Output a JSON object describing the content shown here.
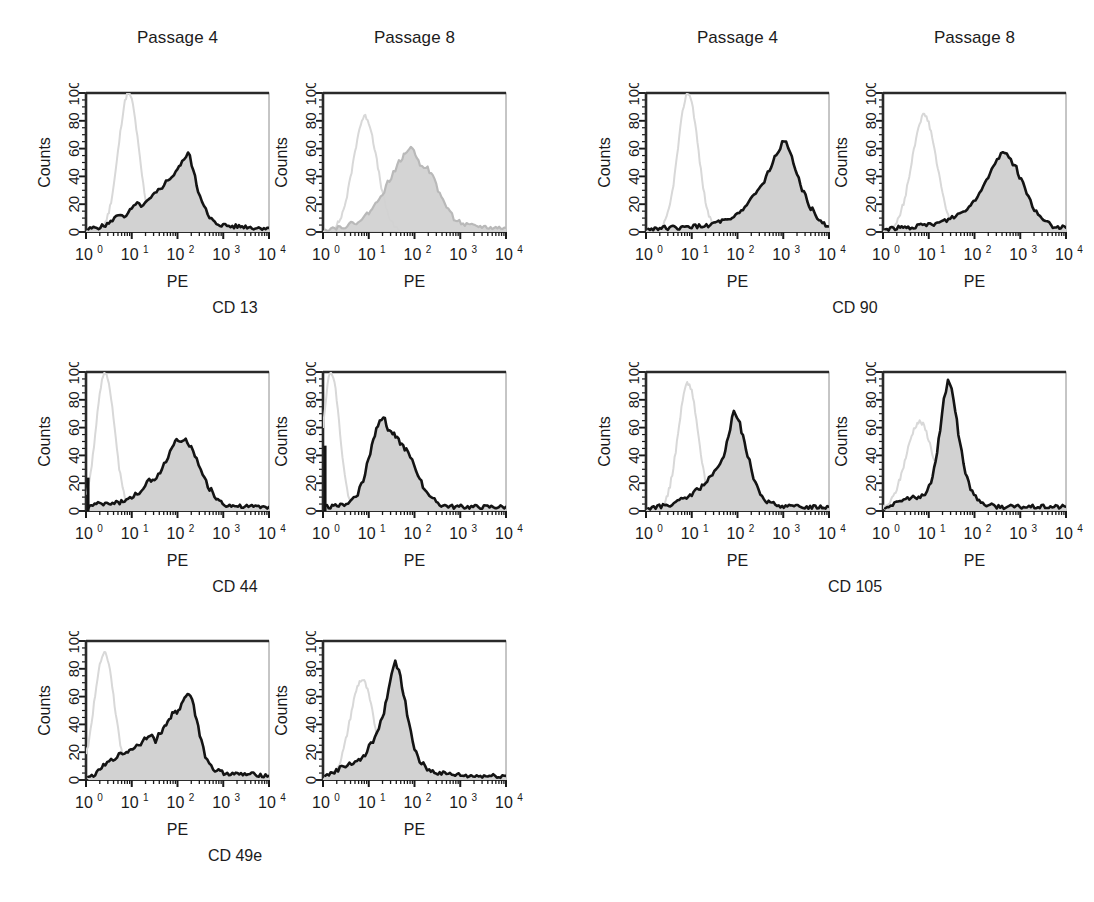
{
  "figure": {
    "background": "#ffffff",
    "width": 1094,
    "height": 902,
    "column_headers": [
      {
        "label": "Passage 4"
      },
      {
        "label": "Passage 8"
      },
      {
        "label": "Passage 4"
      },
      {
        "label": "Passage 8"
      }
    ],
    "marker_labels": [
      {
        "label": "CD 13"
      },
      {
        "label": "CD 90"
      },
      {
        "label": "CD 44"
      },
      {
        "label": "CD 105"
      },
      {
        "label": "CD 49e"
      }
    ]
  },
  "axes": {
    "x_title": "PE",
    "y_title": "Counts",
    "x_ticks": [
      {
        "mantissa": "10",
        "exponent": "0"
      },
      {
        "mantissa": "10",
        "exponent": "1"
      },
      {
        "mantissa": "10",
        "exponent": "2"
      },
      {
        "mantissa": "10",
        "exponent": "3"
      },
      {
        "mantissa": "10",
        "exponent": "4"
      }
    ],
    "y_ticks": [
      "0",
      "20",
      "40",
      "60",
      "80",
      "100"
    ],
    "x_range_decades": [
      0,
      4
    ],
    "y_range": [
      0,
      100
    ],
    "x_scale": "log",
    "grid": false
  },
  "style": {
    "fill_color": "#d2d2d2",
    "sample_line_color": "#141414",
    "control_line_color": "#d8d8d8",
    "frame_color": "#2a2a2a",
    "tick_color": "#1a1a1a"
  },
  "chart_data": {
    "type": "line",
    "xlabel": "PE",
    "ylabel": "Counts",
    "xlim": [
      1,
      10000
    ],
    "ylim": [
      0,
      100
    ],
    "xscale": "log",
    "grid": false,
    "legend": "none",
    "panels": [
      {
        "marker": "CD 13",
        "passage": "Passage 4",
        "row": 0,
        "col": 0,
        "control": {
          "name": "isotype control",
          "peak_decade": 0.93,
          "peak_height": 100,
          "width": 0.22
        },
        "sample": {
          "name": "stained sample",
          "peak_decade": 2.23,
          "peak_height": 57,
          "x_decades": [
            0.05,
            0.2,
            0.35,
            0.5,
            0.62,
            0.75,
            0.88,
            1.0,
            1.12,
            1.25,
            1.38,
            1.5,
            1.62,
            1.75,
            1.88,
            2.0,
            2.1,
            2.23,
            2.35,
            2.45,
            2.58,
            2.7,
            2.85,
            3.0,
            3.2,
            3.45,
            3.7,
            4.0
          ],
          "y_values": [
            2,
            3,
            4,
            6,
            10,
            13,
            11,
            17,
            20,
            19,
            23,
            27,
            31,
            36,
            40,
            45,
            50,
            57,
            45,
            30,
            18,
            10,
            6,
            5,
            4,
            4,
            3,
            3
          ]
        }
      },
      {
        "marker": "CD 13",
        "passage": "Passage 8",
        "row": 0,
        "col": 1,
        "faded": true,
        "control": {
          "name": "isotype control",
          "peak_decade": 0.92,
          "peak_height": 83,
          "width": 0.26
        },
        "sample": {
          "name": "stained sample",
          "peak_decade": 1.92,
          "peak_height": 62,
          "x_decades": [
            0.05,
            0.25,
            0.45,
            0.65,
            0.85,
            1.0,
            1.15,
            1.3,
            1.45,
            1.58,
            1.7,
            1.8,
            1.92,
            2.02,
            2.12,
            2.25,
            2.4,
            2.55,
            2.7,
            2.9,
            3.1,
            3.4,
            3.7,
            4.0
          ],
          "y_values": [
            2,
            3,
            4,
            6,
            9,
            14,
            20,
            28,
            37,
            45,
            52,
            56,
            62,
            56,
            49,
            47,
            40,
            28,
            18,
            9,
            5,
            4,
            3,
            3
          ]
        }
      },
      {
        "marker": "CD 90",
        "passage": "Passage 4",
        "row": 0,
        "col": 2,
        "control": {
          "name": "isotype control",
          "peak_decade": 0.92,
          "peak_height": 100,
          "width": 0.22
        },
        "sample": {
          "name": "stained sample",
          "peak_decade": 3.02,
          "peak_height": 66,
          "x_decades": [
            0.05,
            0.3,
            0.55,
            0.8,
            1.0,
            1.2,
            1.4,
            1.55,
            1.7,
            1.85,
            2.0,
            2.12,
            2.25,
            2.4,
            2.55,
            2.7,
            2.85,
            3.02,
            3.15,
            3.3,
            3.45,
            3.6,
            3.78,
            4.0
          ],
          "y_values": [
            2,
            3,
            3,
            3,
            4,
            4,
            5,
            7,
            8,
            8,
            13,
            16,
            22,
            28,
            34,
            44,
            55,
            66,
            57,
            43,
            28,
            17,
            9,
            4
          ]
        }
      },
      {
        "marker": "CD 90",
        "passage": "Passage 8",
        "row": 0,
        "col": 3,
        "control": {
          "name": "isotype control",
          "peak_decade": 0.9,
          "peak_height": 84,
          "width": 0.27
        },
        "sample": {
          "name": "stained sample",
          "peak_decade": 2.62,
          "peak_height": 58,
          "x_decades": [
            0.05,
            0.3,
            0.55,
            0.75,
            0.95,
            1.15,
            1.35,
            1.55,
            1.72,
            1.88,
            2.02,
            2.15,
            2.3,
            2.45,
            2.62,
            2.75,
            2.88,
            3.02,
            3.18,
            3.35,
            3.55,
            3.75,
            4.0
          ],
          "y_values": [
            2,
            3,
            3,
            4,
            5,
            6,
            8,
            11,
            14,
            18,
            24,
            31,
            40,
            50,
            58,
            54,
            48,
            38,
            25,
            14,
            7,
            4,
            3
          ]
        }
      },
      {
        "marker": "CD 44",
        "passage": "Passage 4",
        "row": 1,
        "col": 0,
        "spike_at_origin": 24,
        "control": {
          "name": "isotype control",
          "peak_decade": 0.42,
          "peak_height": 100,
          "width": 0.2
        },
        "sample": {
          "name": "stained sample",
          "peak_decade": 1.98,
          "peak_height": 53,
          "x_decades": [
            0.05,
            0.15,
            0.3,
            0.5,
            0.7,
            0.88,
            1.0,
            1.12,
            1.25,
            1.38,
            1.5,
            1.62,
            1.75,
            1.88,
            1.98,
            2.08,
            2.18,
            2.3,
            2.42,
            2.55,
            2.7,
            2.88,
            3.1,
            3.4,
            3.7,
            4.0
          ],
          "y_values": [
            3,
            4,
            5,
            5,
            6,
            8,
            9,
            13,
            15,
            22,
            21,
            28,
            36,
            46,
            53,
            49,
            51,
            46,
            37,
            26,
            16,
            8,
            4,
            3,
            3,
            3
          ]
        }
      },
      {
        "marker": "CD 44",
        "passage": "Passage 8",
        "row": 1,
        "col": 1,
        "spike_at_origin": 47,
        "control": {
          "name": "isotype control",
          "peak_decade": 0.18,
          "peak_height": 100,
          "width": 0.18
        },
        "sample": {
          "name": "stained sample",
          "peak_decade": 1.32,
          "peak_height": 68,
          "x_decades": [
            0.05,
            0.2,
            0.38,
            0.55,
            0.72,
            0.88,
            1.0,
            1.1,
            1.2,
            1.32,
            1.42,
            1.52,
            1.62,
            1.72,
            1.82,
            1.95,
            2.08,
            2.22,
            2.4,
            2.62,
            2.9,
            3.2,
            3.6,
            4.0
          ],
          "y_values": [
            3,
            3,
            4,
            6,
            11,
            22,
            38,
            52,
            62,
            68,
            59,
            56,
            52,
            48,
            44,
            36,
            26,
            16,
            8,
            4,
            3,
            3,
            3,
            3
          ]
        }
      },
      {
        "marker": "CD 105",
        "passage": "Passage 4",
        "row": 1,
        "col": 2,
        "control": {
          "name": "isotype control",
          "peak_decade": 0.92,
          "peak_height": 92,
          "width": 0.22
        },
        "sample": {
          "name": "stained sample",
          "peak_decade": 1.92,
          "peak_height": 72,
          "x_decades": [
            0.05,
            0.25,
            0.45,
            0.65,
            0.85,
            1.0,
            1.15,
            1.3,
            1.45,
            1.58,
            1.7,
            1.8,
            1.92,
            2.02,
            2.12,
            2.22,
            2.35,
            2.5,
            2.68,
            2.9,
            3.2,
            3.55,
            4.0
          ],
          "y_values": [
            2,
            3,
            4,
            6,
            9,
            12,
            16,
            20,
            26,
            31,
            40,
            52,
            72,
            66,
            54,
            40,
            24,
            12,
            6,
            4,
            3,
            3,
            3
          ]
        }
      },
      {
        "marker": "CD 105",
        "passage": "Passage 8",
        "row": 1,
        "col": 3,
        "control": {
          "name": "isotype control",
          "peak_decade": 0.8,
          "peak_height": 64,
          "width": 0.3
        },
        "sample": {
          "name": "stained sample",
          "peak_decade": 1.42,
          "peak_height": 94,
          "x_decades": [
            0.05,
            0.25,
            0.45,
            0.62,
            0.78,
            0.92,
            1.05,
            1.15,
            1.25,
            1.33,
            1.42,
            1.5,
            1.58,
            1.68,
            1.8,
            1.95,
            2.1,
            2.3,
            2.6,
            2.95,
            3.35,
            3.7,
            4.0
          ],
          "y_values": [
            3,
            5,
            8,
            10,
            9,
            12,
            20,
            36,
            58,
            80,
            94,
            88,
            72,
            50,
            28,
            14,
            7,
            4,
            3,
            3,
            3,
            3,
            3
          ]
        }
      },
      {
        "marker": "CD 49e",
        "passage": "Passage 4",
        "row": 2,
        "col": 0,
        "control": {
          "name": "isotype control",
          "peak_decade": 0.4,
          "peak_height": 92,
          "width": 0.22
        },
        "sample": {
          "name": "stained sample",
          "peak_decade": 2.22,
          "peak_height": 63,
          "x_decades": [
            0.05,
            0.2,
            0.38,
            0.55,
            0.72,
            0.88,
            1.02,
            1.15,
            1.28,
            1.4,
            1.52,
            1.62,
            1.72,
            1.82,
            1.92,
            2.02,
            2.12,
            2.22,
            2.32,
            2.42,
            2.52,
            2.65,
            2.82,
            3.05,
            3.35,
            3.7,
            4.0
          ],
          "y_values": [
            2,
            4,
            10,
            14,
            18,
            20,
            23,
            25,
            30,
            33,
            28,
            34,
            38,
            44,
            49,
            49,
            56,
            63,
            58,
            44,
            28,
            14,
            7,
            5,
            4,
            4,
            3
          ]
        }
      },
      {
        "marker": "CD 49e",
        "passage": "Passage 8",
        "row": 2,
        "col": 1,
        "control": {
          "name": "isotype control",
          "peak_decade": 0.85,
          "peak_height": 72,
          "width": 0.26
        },
        "sample": {
          "name": "stained sample",
          "peak_decade": 1.58,
          "peak_height": 86,
          "x_decades": [
            0.05,
            0.25,
            0.45,
            0.62,
            0.78,
            0.92,
            1.05,
            1.18,
            1.3,
            1.4,
            1.5,
            1.58,
            1.66,
            1.76,
            1.88,
            2.0,
            2.15,
            2.32,
            2.55,
            2.85,
            3.2,
            3.6,
            4.0
          ],
          "y_values": [
            3,
            6,
            10,
            12,
            14,
            18,
            26,
            34,
            44,
            60,
            76,
            86,
            78,
            62,
            40,
            22,
            12,
            7,
            5,
            4,
            3,
            3,
            3
          ]
        }
      }
    ]
  }
}
